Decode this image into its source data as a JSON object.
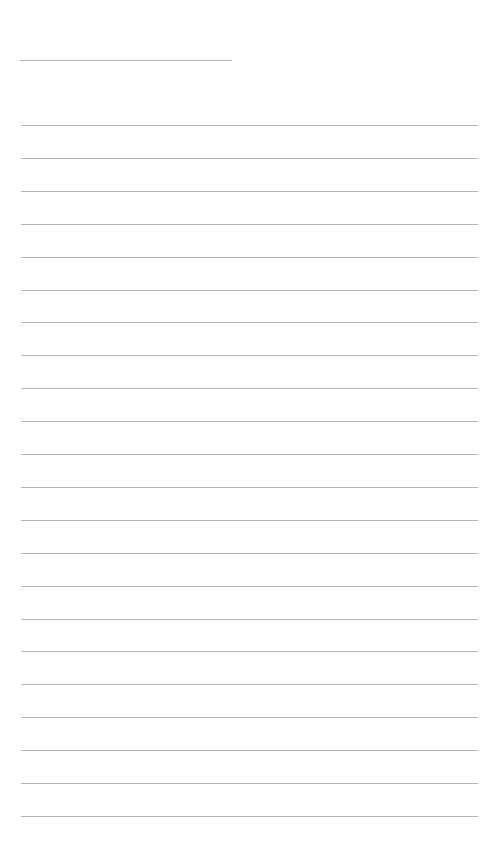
{
  "page": {
    "type": "lined-paper",
    "background_color": "#ffffff",
    "rule_color": "#b4b4b4",
    "title_line": {
      "text": ""
    },
    "writing_lines": [
      {
        "text": ""
      },
      {
        "text": ""
      },
      {
        "text": ""
      },
      {
        "text": ""
      },
      {
        "text": ""
      },
      {
        "text": ""
      },
      {
        "text": ""
      },
      {
        "text": ""
      },
      {
        "text": ""
      },
      {
        "text": ""
      },
      {
        "text": ""
      },
      {
        "text": ""
      },
      {
        "text": ""
      },
      {
        "text": ""
      },
      {
        "text": ""
      },
      {
        "text": ""
      },
      {
        "text": ""
      },
      {
        "text": ""
      },
      {
        "text": ""
      },
      {
        "text": ""
      },
      {
        "text": ""
      },
      {
        "text": ""
      }
    ]
  }
}
